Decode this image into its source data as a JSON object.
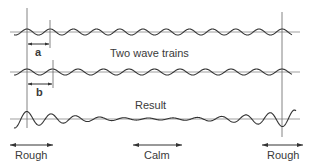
{
  "diagram": {
    "title_label": "Two wave trains",
    "result_label": "Result",
    "marker_a": "a",
    "marker_b": "b",
    "region_labels": {
      "left": "Rough",
      "center": "Calm",
      "right": "Rough"
    },
    "colors": {
      "line": "#555555",
      "wave": "#333333",
      "background": "#ffffff"
    }
  }
}
